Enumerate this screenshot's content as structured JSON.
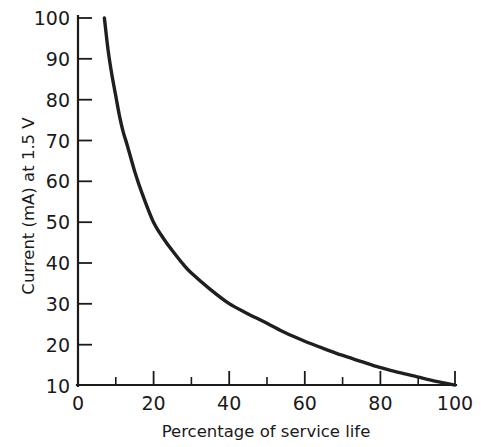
{
  "chart_data": {
    "type": "line",
    "title": "",
    "subtitle": "",
    "xlabel": "Percentage of service life",
    "ylabel": "Current (mA) at 1.5 V",
    "xlim": [
      0,
      100
    ],
    "ylim": [
      10,
      100
    ],
    "grid": false,
    "legend": null,
    "legend_position": "none",
    "x_ticks_major": [
      0,
      20,
      40,
      60,
      80,
      100
    ],
    "x_ticks_minor": [
      10,
      30,
      50,
      70,
      90
    ],
    "x_tick_labels": [
      "0",
      "20",
      "40",
      "60",
      "80",
      "100"
    ],
    "y_ticks_major": [
      10,
      20,
      30,
      40,
      50,
      60,
      70,
      80,
      90,
      100
    ],
    "y_tick_labels": [
      "10",
      "20",
      "30",
      "40",
      "50",
      "60",
      "70",
      "80",
      "90",
      "100"
    ],
    "tick_direction": "in",
    "series": [
      {
        "name": "Discharge current vs service life",
        "color": "#1f1f1f",
        "x": [
          7,
          8,
          9,
          10,
          11,
          12,
          13,
          15,
          17,
          20,
          23,
          25,
          28,
          30,
          35,
          40,
          45,
          50,
          55,
          60,
          65,
          70,
          75,
          80,
          85,
          90,
          95,
          100
        ],
        "y": [
          100,
          92,
          86,
          81,
          76,
          72,
          69,
          62.5,
          57,
          50,
          45.5,
          43,
          39.5,
          37.5,
          33.5,
          30,
          27.5,
          25.2,
          22.8,
          20.8,
          19,
          17.3,
          15.8,
          14.3,
          13.1,
          12.0,
          10.9,
          10
        ]
      }
    ]
  },
  "axes": {
    "x_axis_name": "Percentage of service life",
    "y_axis_name": "Current (mA) at 1.5 V"
  }
}
